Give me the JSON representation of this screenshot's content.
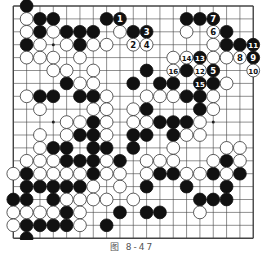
{
  "figure": {
    "caption": "图 8-47",
    "board_size": 19,
    "colors": {
      "black": "#111111",
      "white": "#ffffff",
      "line": "#444444",
      "background": "#ffffff"
    }
  },
  "stones": {
    "black": [
      [
        1,
        0
      ],
      [
        2,
        1
      ],
      [
        3,
        1
      ],
      [
        7,
        1
      ],
      [
        13,
        1
      ],
      [
        14,
        1
      ],
      [
        2,
        2
      ],
      [
        4,
        2
      ],
      [
        5,
        2
      ],
      [
        6,
        2
      ],
      [
        9,
        2
      ],
      [
        16,
        2
      ],
      [
        1,
        3
      ],
      [
        5,
        3
      ],
      [
        16,
        3
      ],
      [
        17,
        3
      ],
      [
        10,
        5
      ],
      [
        13,
        5
      ],
      [
        4,
        6
      ],
      [
        9,
        6
      ],
      [
        11,
        6
      ],
      [
        12,
        6
      ],
      [
        15,
        6
      ],
      [
        2,
        7
      ],
      [
        3,
        7
      ],
      [
        5,
        7
      ],
      [
        6,
        7
      ],
      [
        13,
        7
      ],
      [
        14,
        7
      ],
      [
        10,
        8
      ],
      [
        14,
        8
      ],
      [
        6,
        9
      ],
      [
        11,
        9
      ],
      [
        12,
        9
      ],
      [
        13,
        9
      ],
      [
        5,
        10
      ],
      [
        6,
        10
      ],
      [
        9,
        10
      ],
      [
        10,
        10
      ],
      [
        12,
        10
      ],
      [
        3,
        11
      ],
      [
        4,
        11
      ],
      [
        6,
        11
      ],
      [
        7,
        11
      ],
      [
        9,
        11
      ],
      [
        4,
        12
      ],
      [
        5,
        12
      ],
      [
        6,
        12
      ],
      [
        8,
        12
      ],
      [
        16,
        12
      ],
      [
        1,
        13
      ],
      [
        6,
        13
      ],
      [
        11,
        13
      ],
      [
        12,
        13
      ],
      [
        15,
        13
      ],
      [
        17,
        13
      ],
      [
        1,
        14
      ],
      [
        2,
        14
      ],
      [
        3,
        14
      ],
      [
        4,
        14
      ],
      [
        5,
        14
      ],
      [
        10,
        14
      ],
      [
        13,
        14
      ],
      [
        16,
        14
      ],
      [
        0,
        15
      ],
      [
        1,
        15
      ],
      [
        3,
        15
      ],
      [
        14,
        15
      ],
      [
        15,
        15
      ],
      [
        16,
        15
      ],
      [
        4,
        16
      ],
      [
        8,
        16
      ],
      [
        10,
        16
      ],
      [
        11,
        16
      ],
      [
        1,
        17
      ],
      [
        2,
        17
      ],
      [
        3,
        17
      ],
      [
        4,
        17
      ],
      [
        7,
        17
      ],
      [
        1,
        18
      ]
    ],
    "white": [
      [
        1,
        1
      ],
      [
        1,
        2
      ],
      [
        3,
        2
      ],
      [
        8,
        2
      ],
      [
        13,
        2
      ],
      [
        2,
        3
      ],
      [
        4,
        3
      ],
      [
        6,
        3
      ],
      [
        7,
        3
      ],
      [
        15,
        3
      ],
      [
        1,
        4
      ],
      [
        2,
        4
      ],
      [
        3,
        4
      ],
      [
        5,
        4
      ],
      [
        12,
        4
      ],
      [
        15,
        4
      ],
      [
        16,
        4
      ],
      [
        3,
        5
      ],
      [
        4,
        5
      ],
      [
        6,
        5
      ],
      [
        5,
        6
      ],
      [
        6,
        6
      ],
      [
        16,
        6
      ],
      [
        1,
        7
      ],
      [
        7,
        7
      ],
      [
        10,
        7
      ],
      [
        11,
        7
      ],
      [
        12,
        7
      ],
      [
        15,
        7
      ],
      [
        2,
        8
      ],
      [
        6,
        8
      ],
      [
        7,
        8
      ],
      [
        9,
        8
      ],
      [
        15,
        8
      ],
      [
        4,
        9
      ],
      [
        5,
        9
      ],
      [
        7,
        9
      ],
      [
        9,
        9
      ],
      [
        10,
        9
      ],
      [
        14,
        9
      ],
      [
        2,
        10
      ],
      [
        4,
        10
      ],
      [
        7,
        10
      ],
      [
        13,
        10
      ],
      [
        14,
        10
      ],
      [
        2,
        11
      ],
      [
        12,
        11
      ],
      [
        16,
        11
      ],
      [
        17,
        11
      ],
      [
        1,
        12
      ],
      [
        2,
        12
      ],
      [
        3,
        12
      ],
      [
        7,
        12
      ],
      [
        10,
        12
      ],
      [
        11,
        12
      ],
      [
        12,
        12
      ],
      [
        15,
        12
      ],
      [
        17,
        12
      ],
      [
        0,
        13
      ],
      [
        2,
        13
      ],
      [
        3,
        13
      ],
      [
        4,
        13
      ],
      [
        5,
        13
      ],
      [
        7,
        13
      ],
      [
        8,
        13
      ],
      [
        10,
        13
      ],
      [
        13,
        13
      ],
      [
        14,
        13
      ],
      [
        16,
        13
      ],
      [
        6,
        14
      ],
      [
        8,
        14
      ],
      [
        4,
        15
      ],
      [
        5,
        15
      ],
      [
        6,
        15
      ],
      [
        7,
        15
      ],
      [
        9,
        15
      ],
      [
        0,
        16
      ],
      [
        1,
        16
      ],
      [
        2,
        16
      ],
      [
        3,
        16
      ],
      [
        5,
        16
      ],
      [
        14,
        16
      ],
      [
        0,
        17
      ],
      [
        5,
        17
      ]
    ],
    "numbered": [
      {
        "n": "1",
        "color": "black",
        "pos": [
          8,
          1
        ]
      },
      {
        "n": "2",
        "color": "white",
        "pos": [
          9,
          3
        ]
      },
      {
        "n": "3",
        "color": "black",
        "pos": [
          10,
          2
        ]
      },
      {
        "n": "4",
        "color": "white",
        "pos": [
          10,
          3
        ]
      },
      {
        "n": "5",
        "color": "black",
        "pos": [
          15,
          5
        ]
      },
      {
        "n": "6",
        "color": "white",
        "pos": [
          15,
          2
        ]
      },
      {
        "n": "7",
        "color": "black",
        "pos": [
          15,
          1
        ]
      },
      {
        "n": "8",
        "color": "white",
        "pos": [
          17,
          4
        ]
      },
      {
        "n": "9",
        "color": "black",
        "pos": [
          18,
          4
        ]
      },
      {
        "n": "10",
        "color": "white",
        "pos": [
          18,
          5
        ]
      },
      {
        "n": "11",
        "color": "black",
        "pos": [
          18,
          3
        ]
      },
      {
        "n": "12",
        "color": "white",
        "pos": [
          14,
          5
        ]
      },
      {
        "n": "13",
        "color": "black",
        "pos": [
          14,
          4
        ]
      },
      {
        "n": "14",
        "color": "white",
        "pos": [
          13,
          4
        ]
      },
      {
        "n": "15",
        "color": "black",
        "pos": [
          14,
          6
        ]
      },
      {
        "n": "16",
        "color": "white",
        "pos": [
          12,
          5
        ]
      }
    ]
  },
  "star_points": [
    [
      3,
      3
    ],
    [
      9,
      3
    ],
    [
      15,
      3
    ],
    [
      3,
      9
    ],
    [
      9,
      9
    ],
    [
      15,
      9
    ],
    [
      3,
      15
    ],
    [
      9,
      15
    ],
    [
      15,
      15
    ]
  ]
}
